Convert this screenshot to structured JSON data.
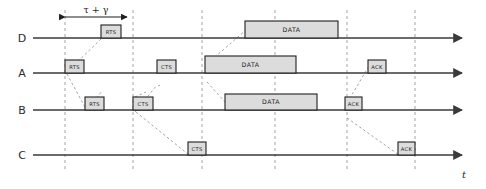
{
  "diagram": {
    "axis": {
      "time_label": "t",
      "arrow_end_x": 462
    },
    "span_annotation": {
      "label": "τ + γ",
      "x1": 65,
      "x2": 127,
      "y": 17
    },
    "colors": {
      "packet_fill": "#dcdcdc",
      "packet_stroke": "#1f1f1f",
      "timeline": "#3a3a3a",
      "guide": "#9a9a9a",
      "text": "#1f1f1f"
    },
    "guide_lines_x": [
      65,
      133,
      202,
      275,
      347,
      415
    ],
    "rows": [
      {
        "label": "D",
        "y": 38,
        "label_x": 22,
        "line_start": 33,
        "packets": [
          {
            "text": "RTS",
            "x": 101,
            "w": 20,
            "h": 13,
            "size": "small"
          },
          {
            "text": "DATA",
            "x": 245,
            "w": 93,
            "h": 17,
            "size": "big"
          }
        ]
      },
      {
        "label": "A",
        "y": 73,
        "label_x": 22,
        "line_start": 33,
        "packets": [
          {
            "text": "RTS",
            "x": 65,
            "w": 19,
            "h": 13,
            "size": "small"
          },
          {
            "text": "CTS",
            "x": 157,
            "w": 19,
            "h": 13,
            "size": "small"
          },
          {
            "text": "DATA",
            "x": 205,
            "w": 91,
            "h": 17,
            "size": "big"
          },
          {
            "text": "ACK",
            "x": 368,
            "w": 18,
            "h": 13,
            "size": "small"
          }
        ]
      },
      {
        "label": "B",
        "y": 110,
        "label_x": 22,
        "line_start": 33,
        "packets": [
          {
            "text": "RTS",
            "x": 85,
            "w": 19,
            "h": 13,
            "size": "small"
          },
          {
            "text": "CTS",
            "x": 133,
            "w": 20,
            "h": 13,
            "size": "small"
          },
          {
            "text": "DATA",
            "x": 225,
            "w": 92,
            "h": 16,
            "size": "big"
          },
          {
            "text": "ACK",
            "x": 345,
            "w": 17,
            "h": 13,
            "size": "small"
          }
        ]
      },
      {
        "label": "C",
        "y": 155,
        "label_x": 22,
        "line_start": 33,
        "packets": [
          {
            "text": "CTS",
            "x": 188,
            "w": 18,
            "h": 13,
            "size": "small"
          },
          {
            "text": "ACK",
            "x": 398,
            "w": 17,
            "h": 13,
            "size": "small"
          }
        ]
      }
    ],
    "propagation_arrows": [
      {
        "from_x": 67,
        "from_y": 72,
        "to_x": 101,
        "to_y": 39
      },
      {
        "from_x": 67,
        "from_y": 74,
        "to_x": 86,
        "to_y": 109
      },
      {
        "from_x": 87,
        "from_y": 110,
        "to_x": 102,
        "to_y": 91
      },
      {
        "from_x": 135,
        "from_y": 97,
        "to_x": 146,
        "to_y": 92
      },
      {
        "from_x": 135,
        "from_y": 112,
        "to_x": 157,
        "to_y": 85
      },
      {
        "from_x": 136,
        "from_y": 112,
        "to_x": 189,
        "to_y": 155
      },
      {
        "from_x": 160,
        "from_y": 85,
        "to_x": 158,
        "to_y": 86
      },
      {
        "from_x": 207,
        "from_y": 64,
        "to_x": 246,
        "to_y": 30
      },
      {
        "from_x": 207,
        "from_y": 82,
        "to_x": 226,
        "to_y": 103
      },
      {
        "from_x": 347,
        "from_y": 103,
        "to_x": 369,
        "to_y": 66
      },
      {
        "from_x": 347,
        "from_y": 118,
        "to_x": 399,
        "to_y": 155
      }
    ]
  }
}
